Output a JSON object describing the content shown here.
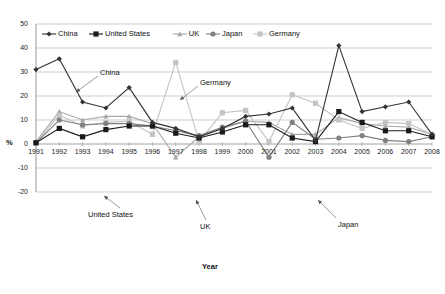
{
  "chart_data": {
    "type": "line",
    "title": "",
    "xlabel": "Year",
    "ylabel": "%",
    "ylim": [
      -20,
      50
    ],
    "ytick_step": 10,
    "yticks": [
      "50",
      "40",
      "30",
      "20",
      "10",
      "0",
      "-10",
      "-20"
    ],
    "grid": true,
    "legend_position": "top-left-inside",
    "categories": [
      "1991",
      "1992",
      "1993",
      "1994",
      "1995",
      "1996",
      "1997",
      "1998",
      "1999",
      "2000",
      "2001",
      "2002",
      "2003",
      "2004",
      "2005",
      "2006",
      "2007",
      "2008"
    ],
    "x": [
      1991,
      1992,
      1993,
      1994,
      1995,
      1996,
      1997,
      1998,
      1999,
      2000,
      2001,
      2002,
      2003,
      2004,
      2005,
      2006,
      2007,
      2008
    ],
    "series": [
      {
        "name": "China",
        "color": "#333333",
        "marker": "diamond",
        "values": [
          31,
          35.5,
          17.5,
          15,
          23.5,
          9,
          6.5,
          3,
          6.5,
          11.5,
          12.5,
          15,
          1.5,
          41,
          13.5,
          15.5,
          17.5,
          4
        ]
      },
      {
        "name": "United States",
        "color": "#1a1a1a",
        "marker": "square",
        "values": [
          0.5,
          6.5,
          3,
          6,
          7.5,
          7.5,
          4.5,
          2.5,
          5,
          8,
          8,
          2.5,
          1,
          13.5,
          9,
          5.5,
          5.5,
          3
        ]
      },
      {
        "name": "UK",
        "color": "#a8a8a8",
        "marker": "triangle",
        "values": [
          1,
          13.5,
          10,
          11.5,
          11.5,
          8.5,
          -5.5,
          3,
          6.5,
          9.5,
          9,
          4,
          4,
          11,
          8.5,
          7.5,
          7,
          4
        ]
      },
      {
        "name": "Japan",
        "color": "#808080",
        "marker": "circle",
        "values": [
          0.5,
          10,
          8,
          8.5,
          8.5,
          7.5,
          5.5,
          3.5,
          7,
          9.5,
          -5.5,
          9,
          2,
          2.5,
          3.5,
          1.5,
          1,
          3
        ]
      },
      {
        "name": "Germany",
        "color": "#c4c4c4",
        "marker": "square",
        "values": [
          0.5,
          12,
          7.5,
          9,
          9.5,
          4,
          34,
          1,
          13,
          14,
          1,
          20.5,
          17,
          10,
          6.5,
          9,
          8.5,
          4
        ]
      }
    ],
    "annotations": [
      {
        "name": "China",
        "text": "China",
        "x": 100,
        "y": 68
      },
      {
        "name": "Germany",
        "text": "Germany",
        "x": 200,
        "y": 78
      },
      {
        "name": "United States",
        "text": "United  States",
        "x": 88,
        "y": 210
      },
      {
        "name": "UK",
        "text": "UK",
        "x": 200,
        "y": 222
      },
      {
        "name": "Japan",
        "text": "Japan",
        "x": 338,
        "y": 220
      }
    ]
  },
  "legend": {
    "items": [
      {
        "label": "China"
      },
      {
        "label": "United States"
      },
      {
        "label": "UK"
      },
      {
        "label": "Japan"
      },
      {
        "label": "Germany"
      }
    ]
  },
  "axes": {
    "x_title": "Year",
    "y_title": "%"
  }
}
